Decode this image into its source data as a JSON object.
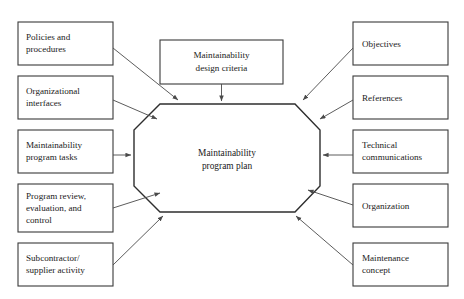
{
  "diagram": {
    "type": "hub-and-spoke-block-diagram",
    "background_color": "#ffffff",
    "box_border_color": "#3a3a3a",
    "arrow_color": "#4a4a4a",
    "text_color": "#1a1a1a",
    "hub": {
      "shape": "octagon",
      "line1": "Maintainability",
      "line2": "program plan"
    },
    "top": {
      "line1": "Maintainability",
      "line2": "design criteria"
    },
    "left_boxes": [
      {
        "line1": "Policies and",
        "line2": "procedures",
        "line3": ""
      },
      {
        "line1": "Organizational",
        "line2": "interfaces",
        "line3": ""
      },
      {
        "line1": "Maintainability",
        "line2": "program tasks",
        "line3": ""
      },
      {
        "line1": "Program review,",
        "line2": "evaluation, and",
        "line3": "control"
      },
      {
        "line1": "Subcontractor/",
        "line2": "supplier activity",
        "line3": ""
      }
    ],
    "right_boxes": [
      {
        "line1": "Objectives",
        "line2": "",
        "line3": ""
      },
      {
        "line1": "References",
        "line2": "",
        "line3": ""
      },
      {
        "line1": "Technical",
        "line2": "communications",
        "line3": ""
      },
      {
        "line1": "Organization",
        "line2": "",
        "line3": ""
      },
      {
        "line1": "Maintenance",
        "line2": "concept",
        "line3": ""
      }
    ]
  }
}
